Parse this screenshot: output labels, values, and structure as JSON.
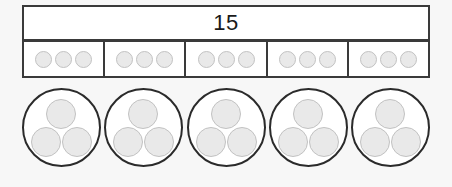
{
  "diagram": {
    "title_value": "15",
    "bar_model": {
      "total_label": "15",
      "parts": [
        {
          "count": 3,
          "chips": [
            "chip",
            "chip",
            "chip"
          ]
        },
        {
          "count": 3,
          "chips": [
            "chip",
            "chip",
            "chip"
          ]
        },
        {
          "count": 3,
          "chips": [
            "chip",
            "chip",
            "chip"
          ]
        },
        {
          "count": 3,
          "chips": [
            "chip",
            "chip",
            "chip"
          ]
        },
        {
          "count": 3,
          "chips": [
            "chip",
            "chip",
            "chip"
          ]
        }
      ]
    },
    "groups": [
      {
        "count": 3,
        "dots": [
          "dot-top",
          "dot-left",
          "dot-right"
        ]
      },
      {
        "count": 3,
        "dots": [
          "dot-top",
          "dot-left",
          "dot-right"
        ]
      },
      {
        "count": 3,
        "dots": [
          "dot-top",
          "dot-left",
          "dot-right"
        ]
      },
      {
        "count": 3,
        "dots": [
          "dot-top",
          "dot-left",
          "dot-right"
        ]
      },
      {
        "count": 3,
        "dots": [
          "dot-top",
          "dot-left",
          "dot-right"
        ]
      }
    ],
    "colors": {
      "background": "#f7f7f7",
      "frame_stroke": "#3a3a3a",
      "circle_stroke": "#2b2b2b",
      "token_fill": "#e9e9e9",
      "token_stroke": "#c2c2c2",
      "cell_fill": "#ffffff",
      "text": "#1a1a1a"
    }
  }
}
